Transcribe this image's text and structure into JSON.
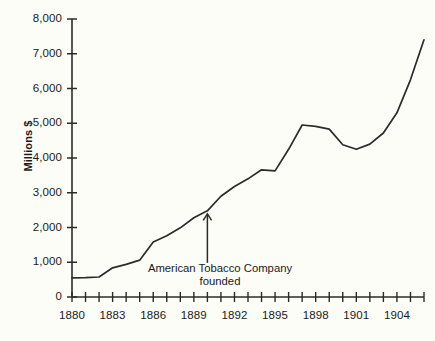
{
  "chart_data": {
    "type": "line",
    "title": "",
    "subtitle": "",
    "xlabel": "",
    "ylabel": "Millions $",
    "xlim": [
      1880,
      1906
    ],
    "ylim": [
      0,
      8000
    ],
    "grid": false,
    "legend": null,
    "x_tick_labels": [
      "1880",
      "1883",
      "1886",
      "1889",
      "1892",
      "1895",
      "1898",
      "1901",
      "1904"
    ],
    "x_tick_values": [
      1880,
      1883,
      1886,
      1889,
      1892,
      1895,
      1898,
      1901,
      1904
    ],
    "x_minor_ticks": [
      1880,
      1881,
      1882,
      1883,
      1884,
      1885,
      1886,
      1887,
      1888,
      1889,
      1890,
      1891,
      1892,
      1893,
      1894,
      1895,
      1896,
      1897,
      1898,
      1899,
      1900,
      1901,
      1902,
      1903,
      1904,
      1905,
      1906
    ],
    "y_tick_labels": [
      "0",
      "1,000",
      "2,000",
      "3,000",
      "4,000",
      "5,000",
      "6,000",
      "7,000",
      "8,000"
    ],
    "y_tick_values": [
      0,
      1000,
      2000,
      3000,
      4000,
      5000,
      6000,
      7000,
      8000
    ],
    "series": [
      {
        "name": "Millions $",
        "color": "#2b2b2b",
        "x": [
          1880,
          1881,
          1882,
          1883,
          1884,
          1885,
          1886,
          1887,
          1888,
          1889,
          1890,
          1891,
          1892,
          1893,
          1894,
          1895,
          1896,
          1897,
          1898,
          1899,
          1900,
          1901,
          1902,
          1903,
          1904,
          1905,
          1906
        ],
        "values": [
          550,
          555,
          575,
          840,
          940,
          1060,
          1580,
          1760,
          1990,
          2280,
          2480,
          2900,
          3180,
          3400,
          3660,
          3630,
          4250,
          4950,
          4910,
          4830,
          4380,
          4250,
          4400,
          4720,
          5300,
          6250,
          7400
        ]
      }
    ],
    "annotations": [
      {
        "text_line1": "American Tobacco Company",
        "text_line2": "founded",
        "target_x": 1890,
        "target_y": 2480,
        "arrow": "up-arrow"
      }
    ]
  },
  "axes": {
    "y_axis_name": "y-axis",
    "x_axis_name": "x-axis"
  },
  "colors": {
    "background": "#fdfdf7",
    "ink": "#2b2b2b",
    "text": "#1a1a1a"
  }
}
